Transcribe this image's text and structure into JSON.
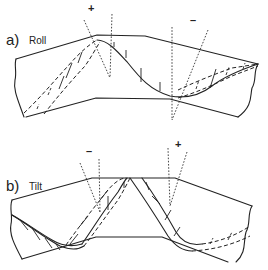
{
  "panels": [
    {
      "id": "a",
      "letter": "a)",
      "name": "Roll",
      "signs": {
        "left": "+",
        "right": "–"
      }
    },
    {
      "id": "b",
      "letter": "b)",
      "name": "Tilt",
      "signs": {
        "left": "–",
        "right": "+"
      }
    }
  ]
}
